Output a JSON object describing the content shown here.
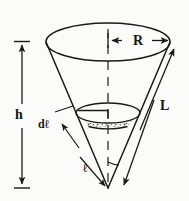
{
  "figure": {
    "background_color": "#fbfbfa",
    "stroke_color": "#1a1a1a",
    "stipple_color": "#4a4a4a"
  },
  "labels": {
    "radius": "R",
    "slant_length": "L",
    "height": "h",
    "differential_slant": "dℓ",
    "slant_distance": "ℓ"
  },
  "annotations": {
    "radius_arrow": "double-headed horizontal arrow from cone axis to top rim, labeled R",
    "slant_arrow": "double-headed slanted arrow along the right outside of the cone, labeled L",
    "height_arrow": "double-headed vertical arrow at far left spanning top rim level to apex level, labeled h",
    "dl_pointer": "leader arrow from the d-ell label up-right to the stippled band",
    "l_pointer": "leader arrow from the ell label down-right toward the apex",
    "axis": "dashed vertical centerline from top rim to apex",
    "apex_angle": "small arc at the apex between the axis and the right slant edge"
  },
  "geometry": {
    "top_ellipse": {
      "cx": 108,
      "cy": 42,
      "rx": 62,
      "ry": 19
    },
    "inner_ellipse": {
      "cx": 108,
      "cy": 113,
      "rx": 32,
      "ry": 10
    },
    "band_thickness_px": 12,
    "apex": {
      "x": 108,
      "y": 188
    }
  }
}
